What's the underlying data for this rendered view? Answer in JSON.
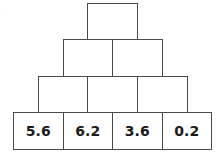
{
  "label": ")",
  "pyramid": {
    "rows": [
      [
        "",
        "",
        "",
        ""
      ],
      [
        "",
        "",
        ""
      ],
      [
        "",
        ""
      ],
      [
        ""
      ]
    ],
    "base": [
      "5.6",
      "6.2",
      "3.6",
      "0.2"
    ]
  }
}
